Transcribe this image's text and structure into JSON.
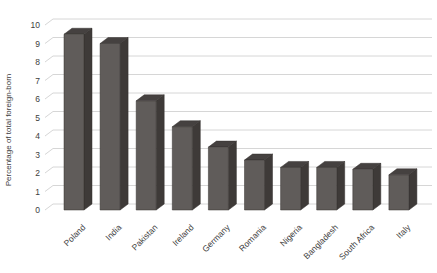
{
  "chart_data": {
    "type": "bar",
    "style": "3d-column",
    "title": "",
    "categories": [
      "Poland",
      "India",
      "Pakistan",
      "Ireland",
      "Germany",
      "Romania",
      "Nigeria",
      "Bangladesh",
      "South Africa",
      "Italy"
    ],
    "values": [
      9.5,
      9.0,
      5.9,
      4.5,
      3.4,
      2.7,
      2.3,
      2.3,
      2.2,
      1.9
    ],
    "xlabel": "",
    "ylabel": "Percentage of total foreign-born",
    "ylim": [
      0,
      10
    ],
    "yticks": [
      0,
      1,
      2,
      3,
      4,
      5,
      6,
      7,
      8,
      9,
      10
    ],
    "grid": true,
    "legend": false,
    "xtick_rotation_deg": 45,
    "colors": {
      "background": "#ffffff",
      "bar_front": "#605c5a",
      "bar_side": "#3e3a38",
      "bar_top": "#454140",
      "bar_outline": "#34302e",
      "gridline": "#d6d6d6",
      "text": "#3d3d3d"
    }
  }
}
